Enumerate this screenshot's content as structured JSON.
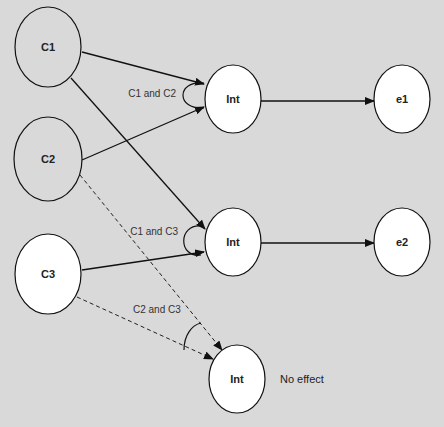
{
  "diagram": {
    "background": "#d9d9d9",
    "nodes": [
      {
        "id": "C1",
        "label": "C1",
        "cx": 48,
        "cy": 47,
        "rx": 33,
        "ry": 40,
        "fill": "#d9d9d9"
      },
      {
        "id": "C2",
        "label": "C2",
        "cx": 48,
        "cy": 159,
        "rx": 34,
        "ry": 42,
        "fill": "#d9d9d9"
      },
      {
        "id": "C3",
        "label": "C3",
        "cx": 48,
        "cy": 274,
        "rx": 33,
        "ry": 40,
        "fill": "#ffffff"
      },
      {
        "id": "Int1",
        "label": "Int",
        "cx": 233,
        "cy": 99,
        "rx": 28,
        "ry": 34,
        "fill": "#ffffff"
      },
      {
        "id": "Int2",
        "label": "Int",
        "cx": 233,
        "cy": 242,
        "rx": 28,
        "ry": 34,
        "fill": "#ffffff"
      },
      {
        "id": "Int3",
        "label": "Int",
        "cx": 237,
        "cy": 379,
        "rx": 28,
        "ry": 34,
        "fill": "#ffffff"
      },
      {
        "id": "e1",
        "label": "e1",
        "cx": 402,
        "cy": 99,
        "rx": 28,
        "ry": 34,
        "fill": "#ffffff"
      },
      {
        "id": "e2",
        "label": "e2",
        "cx": 402,
        "cy": 242,
        "rx": 28,
        "ry": 34,
        "fill": "#ffffff"
      }
    ],
    "edges": [
      {
        "from": "C1",
        "to": "Int1",
        "style": "solid"
      },
      {
        "from": "C2",
        "to": "Int1",
        "style": "solid"
      },
      {
        "from": "C1",
        "to": "Int2",
        "style": "solid"
      },
      {
        "from": "C3",
        "to": "Int2",
        "style": "solid"
      },
      {
        "from": "Int1",
        "to": "e1",
        "style": "solid"
      },
      {
        "from": "Int2",
        "to": "e2",
        "style": "solid"
      },
      {
        "from": "C2",
        "to": "Int3",
        "style": "dashed"
      },
      {
        "from": "C3",
        "to": "Int3",
        "style": "dashed"
      }
    ],
    "annotations": [
      {
        "id": "c1c2",
        "label": "C1 and C2"
      },
      {
        "id": "c1c3",
        "label": "C1 and C3"
      },
      {
        "id": "c2c3",
        "label": "C2 and C3"
      }
    ],
    "free_text": {
      "no_effect": "No effect"
    }
  }
}
